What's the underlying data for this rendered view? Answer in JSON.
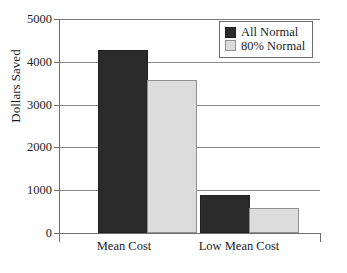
{
  "chart_data": {
    "type": "bar",
    "title": "",
    "xlabel": "",
    "ylabel": "Dollars Saved",
    "categories": [
      "Mean Cost",
      "Low Mean Cost"
    ],
    "series": [
      {
        "name": "All Normal",
        "color": "#2b2b2b",
        "values": [
          4230,
          840
        ]
      },
      {
        "name": "80% Normal",
        "color": "#dcdcdc",
        "values": [
          3530,
          540
        ]
      }
    ],
    "ylim": [
      0,
      5000
    ],
    "yticks": [
      0,
      1000,
      2000,
      3000,
      4000,
      5000
    ],
    "ytick_labels": [
      "0",
      "1000",
      "2000",
      "3000",
      "4000",
      "5000"
    ],
    "grid": true,
    "legend_position": "top-right"
  },
  "legend": {
    "entries": [
      {
        "label": "All Normal"
      },
      {
        "label": "80% Normal"
      }
    ]
  },
  "axes": {
    "y_title": "Dollars Saved",
    "y_labels": [
      "5000",
      "4000",
      "3000",
      "2000",
      "1000",
      "0"
    ],
    "x_labels": [
      "Mean Cost",
      "Low Mean Cost"
    ]
  }
}
